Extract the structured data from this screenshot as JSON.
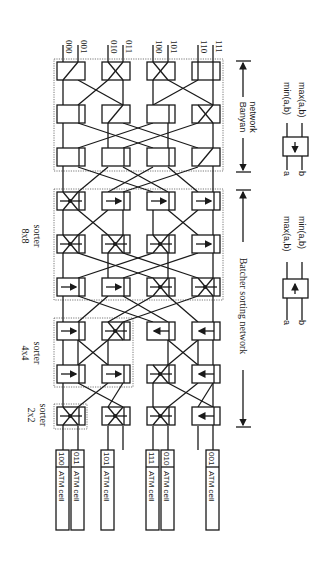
{
  "figure": {
    "outputs": [
      "000",
      "001",
      "010",
      "011",
      "100",
      "101",
      "110",
      "111"
    ],
    "inputs": [
      {
        "label": "ATM cell",
        "addr": "100"
      },
      {
        "label": "ATM cell",
        "addr": "011"
      },
      {
        "label": "ATM cell",
        "addr": "101"
      },
      {
        "label": "ATM cell",
        "addr": "111"
      },
      {
        "label": "ATM cell",
        "addr": "010"
      },
      {
        "label": "ATM cell",
        "addr": "001"
      }
    ],
    "sorter_labels": {
      "s2": {
        "line1": "2x2",
        "line2": "sorter"
      },
      "s4": {
        "line1": "4x4",
        "line2": "sorter"
      },
      "s8": {
        "line1": "8x8",
        "line2": "sorter"
      }
    },
    "brackets": {
      "banyan": {
        "line1": "Banyan",
        "line2": "network"
      },
      "batcher": "Batcher sorting network"
    },
    "legend_up": {
      "a": "a",
      "b": "b",
      "out1": "min(a,b)",
      "out2": "max(a,b)"
    },
    "legend_down": {
      "a": "a",
      "b": "b",
      "out1": "max(a,b)",
      "out2": "min(a,b)"
    }
  }
}
